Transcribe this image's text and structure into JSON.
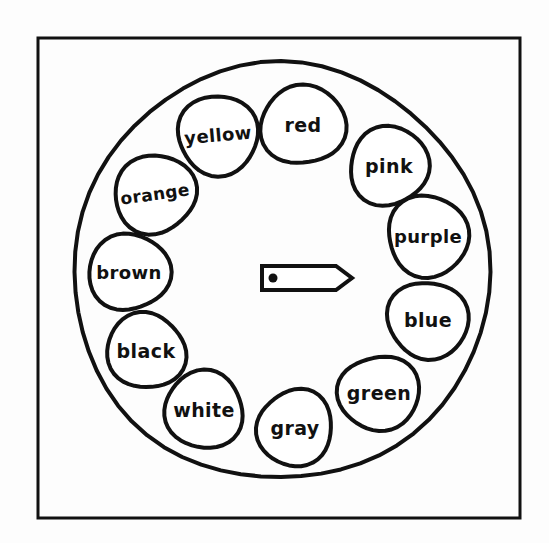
{
  "figure": {
    "kind": "hand-drawn-spinner-wheel",
    "background_color": "#fdfdfd",
    "ink_color": "#111111"
  },
  "frame": {
    "x": 38,
    "y": 38,
    "width": 482,
    "height": 480,
    "stroke_width": 3
  },
  "wheel": {
    "center_x": 281,
    "center_y": 272,
    "radius": 208,
    "stroke_width": 4
  },
  "pointer": {
    "name": "spinner-arrow",
    "pivot_x": 274,
    "pivot_y": 278,
    "tip_x": 352,
    "tip_y": 278,
    "direction_label": "right",
    "stroke_width": 4
  },
  "chart_data": {
    "type": "pie",
    "title": "",
    "xlabel": "",
    "ylabel": "",
    "legend_position": "none",
    "grid": false,
    "categories": [
      "red",
      "pink",
      "purple",
      "blue",
      "green",
      "gray",
      "white",
      "black",
      "brown",
      "orange",
      "yellow"
    ],
    "values": [
      1,
      1,
      1,
      1,
      1,
      1,
      1,
      1,
      1,
      1,
      1
    ],
    "total_segments": 11,
    "segment_probability": "1/11"
  },
  "segments": [
    {
      "label": "red",
      "cx": 303,
      "cy": 125,
      "rx": 42,
      "ry": 40,
      "font_size": 19,
      "rotate": 0
    },
    {
      "label": "pink",
      "cx": 389,
      "cy": 166,
      "rx": 40,
      "ry": 39,
      "font_size": 19,
      "rotate": 0
    },
    {
      "label": "purple",
      "cx": 428,
      "cy": 236,
      "rx": 41,
      "ry": 40,
      "font_size": 18,
      "rotate": 0
    },
    {
      "label": "blue",
      "cx": 428,
      "cy": 320,
      "rx": 40,
      "ry": 39,
      "font_size": 19,
      "rotate": 0
    },
    {
      "label": "green",
      "cx": 379,
      "cy": 393,
      "rx": 40,
      "ry": 38,
      "font_size": 19,
      "rotate": 0
    },
    {
      "label": "gray",
      "cx": 295,
      "cy": 428,
      "rx": 38,
      "ry": 38,
      "font_size": 19,
      "rotate": 0
    },
    {
      "label": "white",
      "cx": 204,
      "cy": 410,
      "rx": 40,
      "ry": 38,
      "font_size": 19,
      "rotate": 0
    },
    {
      "label": "black",
      "cx": 146,
      "cy": 351,
      "rx": 39,
      "ry": 38,
      "font_size": 19,
      "rotate": 0
    },
    {
      "label": "brown",
      "cx": 129,
      "cy": 272,
      "rx": 40,
      "ry": 39,
      "font_size": 18,
      "rotate": 0
    },
    {
      "label": "orange",
      "cx": 155,
      "cy": 194,
      "rx": 41,
      "ry": 39,
      "font_size": 17,
      "rotate": -8
    },
    {
      "label": "yellow",
      "cx": 218,
      "cy": 135,
      "rx": 41,
      "ry": 39,
      "font_size": 18,
      "rotate": -5
    }
  ]
}
